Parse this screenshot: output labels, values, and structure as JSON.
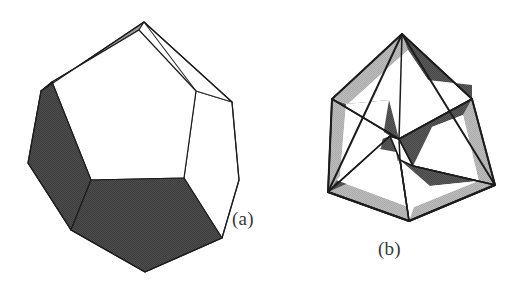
{
  "figure": {
    "background_color": "#ffffff",
    "width": 525,
    "height": 295
  },
  "palette": {
    "white_face": "#ffffff",
    "light_gray_face": "#b0b0b0",
    "mid_gray_face": "#9a9a9a",
    "dark_gray_face": "#4a4a4a",
    "edge_stroke": "#1c1c1c",
    "thin_edge_stroke": "#2b2b2b",
    "caption_color": "#3a3a3a"
  },
  "panels": [
    {
      "id": "panel-a",
      "caption": "(a)",
      "description": "Dodecahedron seen in near face-on projection with outer nonagonal silhouette",
      "face_count": 7,
      "faces": [
        {
          "name": "central-white-pentagon",
          "shade": "white"
        },
        {
          "name": "left-dark-pentagon",
          "shade": "dark"
        },
        {
          "name": "bottom-dark-pentagon",
          "shade": "dark"
        },
        {
          "name": "top-left-gray-sliver",
          "shade": "mid"
        },
        {
          "name": "top-right-white-sliver",
          "shade": "white"
        },
        {
          "name": "right-white-sliver",
          "shade": "white"
        },
        {
          "name": "right-white-pentagon",
          "shade": "white"
        }
      ]
    },
    {
      "id": "panel-b",
      "caption": "(b)",
      "description": "Regular pentagon with five-fold pinwheel symmetry; each of five sectors holds a light band, a dark parallelogram and a white wedge",
      "sector_count": 5,
      "sector_faces": [
        {
          "name": "sector-light-band",
          "shade": "light"
        },
        {
          "name": "sector-dark-parallelogram",
          "shade": "dark"
        },
        {
          "name": "sector-white-wedge",
          "shade": "white"
        }
      ]
    }
  ]
}
